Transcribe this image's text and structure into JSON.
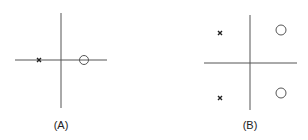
{
  "panels": [
    {
      "label": "(A)",
      "axes": {
        "h": {
          "x1": 15,
          "x2": 107,
          "y": 60
        },
        "v": {
          "x": 61,
          "y1": 13,
          "y2": 108
        }
      },
      "poles": [
        {
          "x": 39,
          "y": 60
        }
      ],
      "zeros": [
        {
          "x": 84,
          "y": 60,
          "r": 4.5
        }
      ],
      "label_pos": {
        "x": 61,
        "y": 119
      }
    },
    {
      "label": "(B)",
      "axes": {
        "h": {
          "x1": 204,
          "x2": 297,
          "y": 63
        },
        "v": {
          "x": 250,
          "y1": 15,
          "y2": 110
        }
      },
      "poles": [
        {
          "x": 220,
          "y": 33
        },
        {
          "x": 220,
          "y": 98
        }
      ],
      "zeros": [
        {
          "x": 281,
          "y": 30,
          "r": 5
        },
        {
          "x": 281,
          "y": 93,
          "r": 5
        }
      ],
      "label_pos": {
        "x": 250,
        "y": 119
      }
    }
  ],
  "colors": {
    "axis": "#555555",
    "marker": "#222222"
  }
}
